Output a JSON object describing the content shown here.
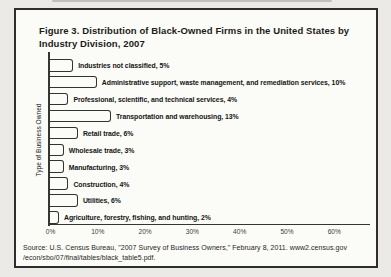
{
  "figure": {
    "title": "Figure 3. Distribution of Black-Owned Firms in the United States by Industry Division, 2007",
    "source_lines": [
      "Source: U.S. Census Bureau, \"2007 Survey of Business Owners,\" February 8, 2011. www2.census.gov",
      "/econ/sbo/07/final/tables/black_table5.pdf."
    ]
  },
  "chart_data": {
    "type": "bar",
    "orientation": "horizontal",
    "title": "Figure 3. Distribution of Black-Owned Firms in the United States by Industry Division, 2007",
    "xlabel": "",
    "ylabel": "Type of Business Owned",
    "xlim": [
      0,
      60
    ],
    "xtick_labels": [
      "0%",
      "10%",
      "20%",
      "30%",
      "40%",
      "50%",
      "60%"
    ],
    "grid": false,
    "legend": "none",
    "categories": [
      "Industries not classified",
      "Administrative support, waste management, and remediation services",
      "Professional, scientific, and technical services",
      "Transportation and warehousing",
      "Retail trade",
      "Wholesale trade",
      "Manufacturing",
      "Construction",
      "Utilities",
      "Agriculture, forestry, fishing, and hunting"
    ],
    "values": [
      5,
      10,
      4,
      13,
      6,
      3,
      3,
      4,
      6,
      2
    ],
    "bar_labels": [
      "Industries not classified, 5%",
      "Administrative support, waste management, and remediation services, 10%",
      "Professional, scientific, and technical services, 4%",
      "Transportation and warehousing, 13%",
      "Retail trade, 6%",
      "Wholesale trade, 3%",
      "Manufacturing, 3%",
      "Construction, 4%",
      "Utilities, 6%",
      "Agriculture, forestry, fishing, and hunting, 2%"
    ],
    "colors": {
      "bar_light": "#d7dbd8",
      "bar_dark": "#2f322f",
      "axis": "#353532",
      "figure_background": "#fbfbf8",
      "page_background": "#eceae7",
      "border": "#2e2e2c",
      "text": "#1b1b19"
    }
  }
}
